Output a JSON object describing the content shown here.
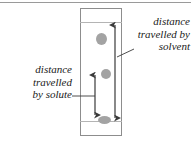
{
  "figure": {
    "top_rule": true
  },
  "plate": {
    "name": "chromatography-plate",
    "border_color": "#8d8d8d",
    "background": "#ffffff",
    "solvent_front_label": "solvent front line",
    "baseline_label": "baseline origin line",
    "line_color": "#b4b4b4"
  },
  "spots": [
    {
      "id": "spot-top",
      "label": "upper solute spot",
      "color": "#a3a3a3"
    },
    {
      "id": "spot-middle",
      "label": "middle solute spot",
      "color": "#a3a3a3"
    },
    {
      "id": "spot-origin",
      "label": "origin spot",
      "color": "#a3a3a3"
    }
  ],
  "annotations": {
    "solvent": {
      "text": "distance\ntravelled by\nsolvent",
      "lines": [
        "distance",
        "travelled by",
        "solvent"
      ],
      "align": "right"
    },
    "solute": {
      "text": "distance\ntravelled\nby solute",
      "lines": [
        "distance",
        "travelled",
        "by solute"
      ],
      "align": "right"
    }
  },
  "arrows": {
    "solvent_arrow": {
      "label": "distance travelled by solvent arrow",
      "color": "#3a3a3a",
      "double_headed": true
    },
    "solute_arrow": {
      "label": "distance travelled by solute arrow",
      "color": "#3a3a3a",
      "double_headed": true
    }
  },
  "leaders": {
    "solvent_leader": {
      "label": "solvent leader line",
      "color": "#3a3a3a"
    },
    "solute_leader": {
      "label": "solute leader line",
      "color": "#3a3a3a"
    }
  }
}
